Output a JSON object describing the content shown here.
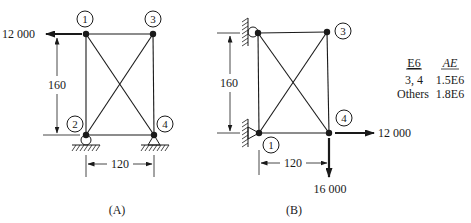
{
  "figure_a": {
    "caption": "(A)",
    "nodes": [
      {
        "id": "1",
        "label": "1"
      },
      {
        "id": "2",
        "label": "2"
      },
      {
        "id": "3",
        "label": "3"
      },
      {
        "id": "4",
        "label": "4"
      }
    ],
    "load": {
      "label": "12 000",
      "node": "1",
      "direction": "left"
    },
    "height_dim": "160",
    "width_dim": "120",
    "supports": [
      {
        "node": "2",
        "type": "roller"
      },
      {
        "node": "4",
        "type": "pin"
      }
    ]
  },
  "figure_b": {
    "caption": "(B)",
    "nodes": [
      {
        "id": "1",
        "label": "1"
      },
      {
        "id": "3",
        "label": "3"
      },
      {
        "id": "4",
        "label": "4"
      }
    ],
    "loads": [
      {
        "label": "12 000",
        "node": "4",
        "direction": "right"
      },
      {
        "label": "16 000",
        "node": "4",
        "direction": "down"
      }
    ],
    "height_dim": "160",
    "width_dim": "120",
    "supports": [
      {
        "node": "top-left",
        "type": "roller-wall"
      },
      {
        "node": "1",
        "type": "pin-wall"
      }
    ]
  },
  "properties_table": {
    "headers": [
      "E6",
      "AE"
    ],
    "rows": [
      [
        "3, 4",
        "1.5E6"
      ],
      [
        "Others",
        "1.8E6"
      ]
    ]
  }
}
